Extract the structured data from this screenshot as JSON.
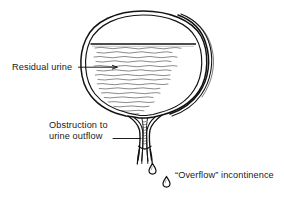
{
  "figure": {
    "type": "medical-line-diagram",
    "background_color": "#ffffff",
    "ink_color": "#1a1a1a",
    "width": 284,
    "height": 198
  },
  "labels": {
    "residual_urine": "Residual urine",
    "obstruction_line1": "Obstruction to",
    "obstruction_line2": "urine outflow",
    "overflow": "“Overflow” incontinence"
  },
  "anatomy": {
    "bladder": {
      "name": "bladder",
      "description": "distended bladder with hypertrophied wall",
      "wall_style": "double-and-triple outline, thickened on right"
    },
    "urine_level": {
      "name": "residual-urine-level",
      "description": "horizontal fluid line near top of bladder"
    },
    "urine_fill": {
      "name": "residual-urine-fill",
      "description": "wavy horizontal hatching representing retained urine"
    },
    "urethra": {
      "name": "urethra",
      "description": "narrowed outflow tract below bladder neck"
    },
    "obstruction": {
      "name": "obstruction",
      "description": "constricted segment at bladder outlet"
    },
    "drops": {
      "name": "urine-drops",
      "count": 2,
      "description": "two teardrops dribbling from urethral meatus"
    }
  },
  "leaders": {
    "residual_urine": "arrow from label crossing left bladder wall into urine",
    "obstruction": "line from label to narrowed urethral segment"
  }
}
